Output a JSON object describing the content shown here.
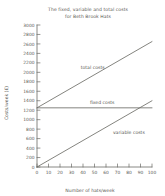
{
  "chart_data": {
    "type": "line",
    "title": "The fixed, variable and total costs for Beth Brook Hats",
    "title_lines": [
      "The fixed, variable and total costs",
      "for Beth Brook Hats"
    ],
    "xlabel": "Number of hats/week",
    "ylabel": "Costs/week (£)",
    "xlim": [
      0,
      100
    ],
    "ylim": [
      0,
      3000
    ],
    "x_ticks": [
      0,
      10,
      20,
      30,
      40,
      50,
      60,
      70,
      80,
      90,
      100
    ],
    "y_ticks": [
      0,
      200,
      400,
      600,
      800,
      1000,
      1200,
      1400,
      1600,
      1800,
      2000,
      2200,
      2400,
      2600,
      2800,
      3000
    ],
    "grid": false,
    "legend_position": "inline-annotations",
    "x": [
      0,
      100
    ],
    "series": [
      {
        "name": "total costs",
        "values": [
          1250,
          2650
        ],
        "label": "total costs",
        "label_x": 38,
        "label_y": 2080
      },
      {
        "name": "fixed costs",
        "values": [
          1250,
          1250
        ],
        "label": "fixed costs",
        "label_x": 46,
        "label_y": 1330
      },
      {
        "name": "variable costs",
        "values": [
          0,
          1400
        ],
        "label": "variable costs",
        "label_x": 66,
        "label_y": 700
      }
    ],
    "colors": {
      "line": "#6e6e68",
      "axis": "#6a6a66",
      "text": "#5a5a55",
      "background": "#ffffff"
    }
  }
}
